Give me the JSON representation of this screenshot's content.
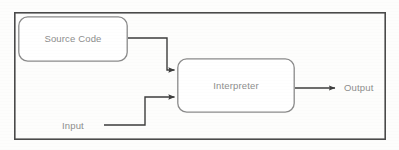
{
  "diagram": {
    "type": "flowchart",
    "outer_border": {
      "name": "outer-frame",
      "x": 14,
      "y": 12,
      "width": 372,
      "height": 128,
      "stroke": "#4a4a4a",
      "stroke_width": 1.6
    },
    "nodes": [
      {
        "id": "source-code",
        "label": "Source Code",
        "shape": "rounded-rect",
        "x": 18,
        "y": 16,
        "width": 110,
        "height": 46,
        "corner_radius": 9,
        "stroke": "#8a8a8a",
        "fill": "#ffffff",
        "text_color": "#8d8d8d"
      },
      {
        "id": "interpreter",
        "label": "Interpreter",
        "shape": "rounded-rect",
        "x": 177,
        "y": 58,
        "width": 118,
        "height": 55,
        "corner_radius": 9,
        "stroke": "#8a8a8a",
        "fill": "#ffffff",
        "text_color": "#8d8d8d"
      }
    ],
    "text_labels": [
      {
        "id": "input",
        "label": "Input",
        "x": 62,
        "y": 121,
        "text_color": "#8d8d8d"
      },
      {
        "id": "output",
        "label": "Output",
        "x": 344,
        "y": 83,
        "text_color": "#8d8d8d"
      }
    ],
    "edges": [
      {
        "id": "source-code-to-interpreter",
        "from": "source-code",
        "to": "interpreter",
        "label": "",
        "path": "M128,38 L167,38 L167,70 L175,70",
        "stroke": "#3d3d3d",
        "stroke_width": 1.4,
        "arrowhead": "filled-triangle"
      },
      {
        "id": "input-to-interpreter",
        "from": "input",
        "to": "interpreter",
        "label": "",
        "path": "M104,125 L145,125 L145,97 L175,97",
        "stroke": "#3d3d3d",
        "stroke_width": 1.4,
        "arrowhead": "filled-triangle"
      },
      {
        "id": "interpreter-to-output",
        "from": "interpreter",
        "to": "output",
        "label": "",
        "path": "M295,88 L336,88",
        "stroke": "#3d3d3d",
        "stroke_width": 1.4,
        "arrowhead": "filled-triangle"
      }
    ],
    "colors": {
      "background": "#fdfdfc",
      "border": "#4a4a4a",
      "node_stroke": "#8a8a8a",
      "edge_stroke": "#3d3d3d",
      "text": "#8d8d8d"
    }
  }
}
